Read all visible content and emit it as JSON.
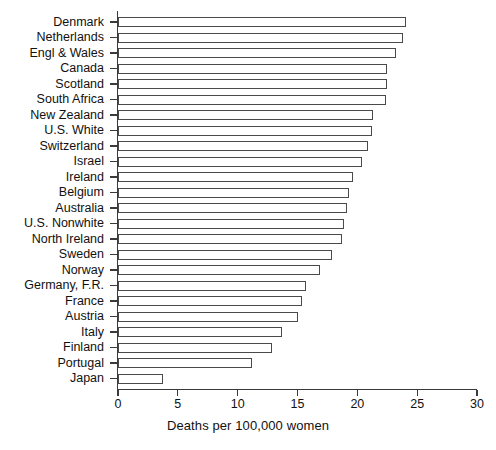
{
  "chart_data": {
    "type": "bar",
    "orientation": "horizontal",
    "title": "",
    "xlabel": "Deaths per 100,000 women",
    "ylabel": "",
    "xlim": [
      0,
      30
    ],
    "xticks": [
      0,
      5,
      10,
      15,
      20,
      25,
      30
    ],
    "grid": false,
    "legend": null,
    "categories": [
      "Denmark",
      "Netherlands",
      "Engl & Wales",
      "Canada",
      "Scotland",
      "South Africa",
      "New Zealand",
      "U.S. White",
      "Switzerland",
      "Israel",
      "Ireland",
      "Belgium",
      "Australia",
      "U.S. Nonwhite",
      "North Ireland",
      "Sweden",
      "Norway",
      "Germany, F.R.",
      "France",
      "Austria",
      "Italy",
      "Finland",
      "Portugal",
      "Japan"
    ],
    "values": [
      24.1,
      23.8,
      23.2,
      22.5,
      22.5,
      22.4,
      21.3,
      21.2,
      20.9,
      20.4,
      19.6,
      19.3,
      19.1,
      18.9,
      18.7,
      17.9,
      16.9,
      15.7,
      15.4,
      15.0,
      13.7,
      12.9,
      11.2,
      3.8
    ]
  },
  "axis": {
    "x_tick_labels": [
      "0",
      "5",
      "10",
      "15",
      "20",
      "25",
      "30"
    ],
    "x_axis_title": "Deaths per 100,000 women"
  },
  "footer": {
    "clipped_caption": ""
  }
}
